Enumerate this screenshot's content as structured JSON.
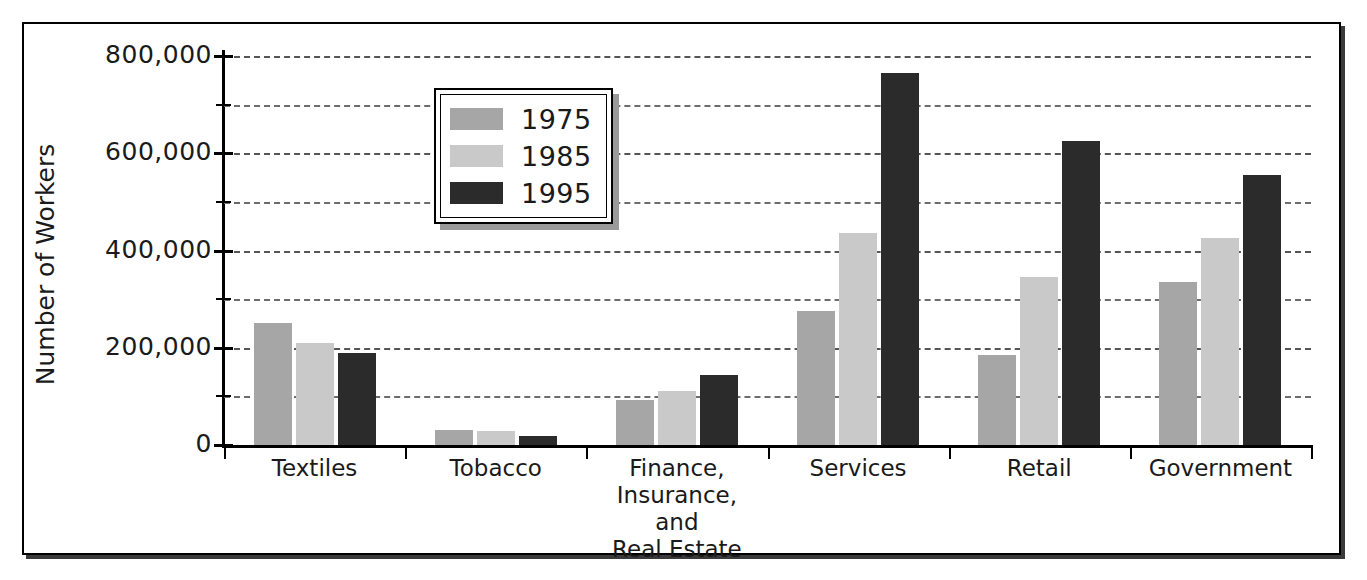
{
  "chart_data": {
    "type": "bar",
    "title": "",
    "subtitle": "",
    "xlabel": "",
    "ylabel": "Number of Workers",
    "ylim": [
      0,
      800000
    ],
    "yticks": [
      0,
      200000,
      400000,
      600000,
      800000
    ],
    "ytick_labels": [
      "0",
      "200,000",
      "400,000",
      "600,000",
      "800,000"
    ],
    "minor_yticks": [
      100000,
      300000,
      500000,
      700000
    ],
    "grid": true,
    "grid_style": "dashed-horizontal",
    "legend_position": "upper-left-inside",
    "categories": [
      "Textiles",
      "Tobacco",
      "Finance,\nInsurance,\nand\nReal Estate",
      "Services",
      "Retail",
      "Government"
    ],
    "category_lines": [
      [
        "Textiles"
      ],
      [
        "Tobacco"
      ],
      [
        "Finance,",
        "Insurance,",
        "and",
        "Real Estate"
      ],
      [
        "Services"
      ],
      [
        "Retail"
      ],
      [
        "Government"
      ]
    ],
    "series": [
      {
        "name": "1975",
        "color": "#a6a6a6",
        "values": [
          250000,
          30000,
          92000,
          275000,
          185000,
          335000
        ]
      },
      {
        "name": "1985",
        "color": "#c9c9c9",
        "values": [
          210000,
          28000,
          112000,
          435000,
          345000,
          425000
        ]
      },
      {
        "name": "1995",
        "color": "#2b2b2b",
        "values": [
          190000,
          18000,
          143000,
          765000,
          625000,
          555000
        ]
      }
    ]
  },
  "colors": {
    "series_1975": "#a6a6a6",
    "series_1985": "#c9c9c9",
    "series_1995": "#2b2b2b",
    "axis": "#000000",
    "grid": "#6c6c6c",
    "background": "#ffffff",
    "frame": "#000000"
  },
  "axis": {
    "y_title": "Number of Workers"
  },
  "legend": {
    "entries": [
      {
        "label": "1975",
        "color": "#a6a6a6"
      },
      {
        "label": "1985",
        "color": "#c9c9c9"
      },
      {
        "label": "1995",
        "color": "#2b2b2b"
      }
    ]
  }
}
